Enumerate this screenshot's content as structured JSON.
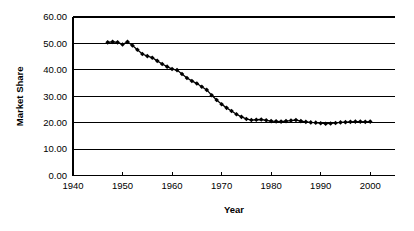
{
  "chart_data": {
    "type": "line",
    "title": "",
    "xlabel": "Year",
    "ylabel": "Market Share",
    "xlim": [
      1940,
      2005
    ],
    "ylim": [
      0,
      60
    ],
    "grid": true,
    "legend": false,
    "x_ticks": [
      1940,
      1950,
      1960,
      1970,
      1980,
      1990,
      2000
    ],
    "x_tick_labels": [
      "1940",
      "1950",
      "1960",
      "1970",
      "1980",
      "1990",
      "2000"
    ],
    "y_ticks": [
      0,
      10,
      20,
      30,
      40,
      50,
      60
    ],
    "y_tick_labels": [
      "0.00",
      "10.00",
      "20.00",
      "30.00",
      "40.00",
      "50.00",
      "60.00"
    ],
    "marker": "diamond",
    "marker_color": "#000000",
    "line_color": "#000000",
    "series": [
      {
        "name": "Market Share",
        "x": [
          1947,
          1948,
          1949,
          1950,
          1951,
          1952,
          1953,
          1954,
          1955,
          1956,
          1957,
          1958,
          1959,
          1960,
          1961,
          1962,
          1963,
          1964,
          1965,
          1966,
          1967,
          1968,
          1969,
          1970,
          1971,
          1972,
          1973,
          1974,
          1975,
          1976,
          1977,
          1978,
          1979,
          1980,
          1981,
          1982,
          1983,
          1984,
          1985,
          1986,
          1987,
          1988,
          1989,
          1990,
          1991,
          1992,
          1993,
          1994,
          1995,
          1996,
          1997,
          1998,
          1999,
          2000
        ],
        "values": [
          50.4,
          50.6,
          50.4,
          49.6,
          50.6,
          49.2,
          47.6,
          46.0,
          45.2,
          44.6,
          43.4,
          42.2,
          41.2,
          40.3,
          39.9,
          38.4,
          36.9,
          35.8,
          34.8,
          33.6,
          32.4,
          30.4,
          28.6,
          27.0,
          25.6,
          24.4,
          23.2,
          22.2,
          21.4,
          21.0,
          21.1,
          21.2,
          20.9,
          20.6,
          20.5,
          20.4,
          20.6,
          20.8,
          21.0,
          20.6,
          20.3,
          20.1,
          20.0,
          19.8,
          19.6,
          19.7,
          19.9,
          20.1,
          20.2,
          20.3,
          20.4,
          20.4,
          20.3,
          20.4
        ]
      }
    ]
  },
  "figure": {
    "background_color": "#ffffff",
    "axis_color": "#000000"
  }
}
